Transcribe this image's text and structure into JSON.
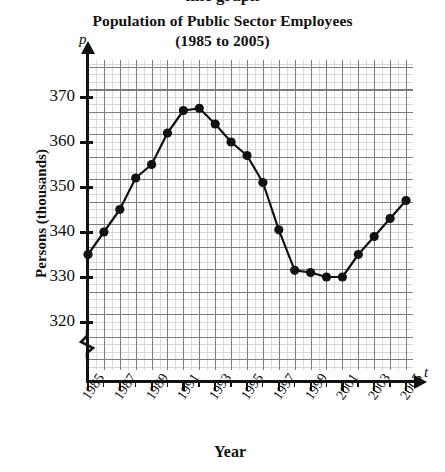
{
  "page": {
    "cut_off_top_text": "line graph"
  },
  "chart_data": {
    "type": "line",
    "title": "Population of Public Sector Employees",
    "subtitle": "(1985 to 2005)",
    "xlabel": "Year",
    "ylabel": "Persons (thousands)",
    "x_axis_symbol": "t",
    "y_axis_symbol": "p",
    "grid": true,
    "axis_break_on_y": true,
    "legend": "none",
    "xlim": [
      1985,
      2005
    ],
    "ylim": [
      315,
      374
    ],
    "ytick_labels": [
      "320",
      "330",
      "340",
      "350",
      "360",
      "370"
    ],
    "yticks": [
      320,
      330,
      340,
      350,
      360,
      370
    ],
    "xtick_labels": [
      "1985",
      "1987",
      "1989",
      "1991",
      "1993",
      "1995",
      "1997",
      "1999",
      "2001",
      "2003",
      "2005"
    ],
    "xticks": [
      1985,
      1987,
      1989,
      1991,
      1993,
      1995,
      1997,
      1999,
      2001,
      2003,
      2005
    ],
    "x": [
      1985,
      1986,
      1987,
      1988,
      1989,
      1990,
      1991,
      1992,
      1993,
      1994,
      1995,
      1996,
      1997,
      1998,
      1999,
      2000,
      2001,
      2002,
      2003,
      2004,
      2005
    ],
    "values": [
      335,
      340,
      345,
      352,
      355,
      362,
      367,
      367.5,
      364,
      360,
      357,
      351,
      340.5,
      331.5,
      331,
      330,
      330,
      335,
      339,
      343,
      347
    ],
    "marker": "filled-circle",
    "line_color": "#111111",
    "marker_color": "#111111",
    "grid_color": "#7d7d7d"
  }
}
